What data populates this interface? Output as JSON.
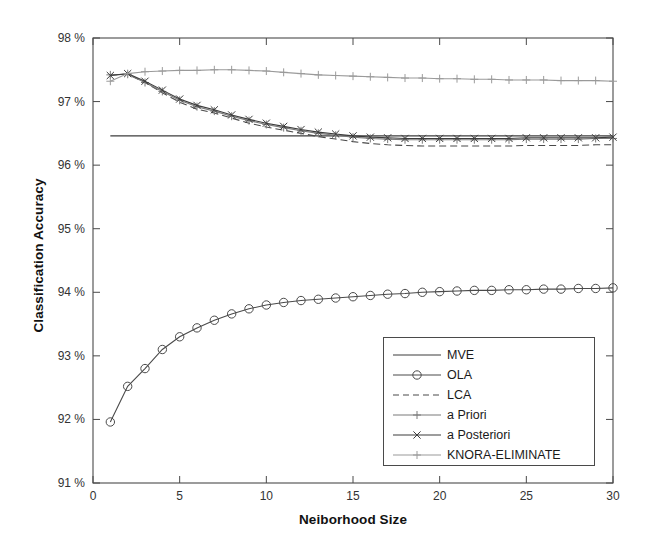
{
  "chart_data": {
    "type": "line",
    "title": "",
    "xlabel": "Neiborhood Size",
    "ylabel": "Classification Accuracy",
    "xlim": [
      0,
      30
    ],
    "ylim": [
      91,
      98
    ],
    "xticks": [
      0,
      5,
      10,
      15,
      20,
      25,
      30
    ],
    "yticks": [
      91,
      92,
      93,
      94,
      95,
      96,
      97,
      98
    ],
    "ytick_labels": [
      "91 %",
      "92 %",
      "93 %",
      "94 %",
      "95 %",
      "96 %",
      "97 %",
      "98 %"
    ],
    "xtick_labels": [
      "0",
      "5",
      "10",
      "15",
      "20",
      "25",
      "30"
    ],
    "grid": false,
    "legend_position": "lower-right",
    "x": [
      1,
      2,
      3,
      4,
      5,
      6,
      7,
      8,
      9,
      10,
      11,
      12,
      13,
      14,
      15,
      16,
      17,
      18,
      19,
      20,
      21,
      22,
      23,
      24,
      25,
      26,
      27,
      28,
      29,
      30
    ],
    "series": [
      {
        "name": "MVE",
        "style": "solid",
        "marker": "none",
        "color": "#3c3c3c",
        "values": [
          96.46,
          96.46,
          96.46,
          96.46,
          96.46,
          96.46,
          96.46,
          96.46,
          96.46,
          96.46,
          96.46,
          96.46,
          96.46,
          96.46,
          96.46,
          96.46,
          96.46,
          96.46,
          96.46,
          96.46,
          96.46,
          96.46,
          96.46,
          96.46,
          96.46,
          96.46,
          96.46,
          96.46,
          96.46,
          96.46
        ]
      },
      {
        "name": "OLA",
        "style": "solid",
        "marker": "circle",
        "color": "#4a4a4a",
        "values": [
          91.96,
          92.52,
          92.8,
          93.1,
          93.3,
          93.44,
          93.56,
          93.66,
          93.74,
          93.8,
          93.84,
          93.87,
          93.89,
          93.91,
          93.93,
          93.95,
          93.97,
          93.98,
          94.0,
          94.01,
          94.02,
          94.03,
          94.03,
          94.04,
          94.04,
          94.05,
          94.05,
          94.06,
          94.06,
          94.07
        ]
      },
      {
        "name": "LCA",
        "style": "dashed",
        "marker": "none",
        "color": "#4a4a4a",
        "values": [
          97.42,
          97.43,
          97.3,
          97.14,
          96.99,
          96.88,
          96.82,
          96.74,
          96.66,
          96.6,
          96.55,
          96.5,
          96.45,
          96.41,
          96.37,
          96.34,
          96.32,
          96.31,
          96.3,
          96.3,
          96.3,
          96.3,
          96.3,
          96.3,
          96.31,
          96.31,
          96.31,
          96.31,
          96.32,
          96.32
        ]
      },
      {
        "name": "a Priori",
        "style": "solid",
        "marker": "plus",
        "color": "#7a7a7a",
        "values": [
          97.42,
          97.43,
          97.3,
          97.16,
          97.02,
          96.92,
          96.85,
          96.77,
          96.7,
          96.64,
          96.59,
          96.54,
          96.5,
          96.47,
          96.44,
          96.42,
          96.41,
          96.4,
          96.4,
          96.4,
          96.4,
          96.4,
          96.4,
          96.4,
          96.41,
          96.41,
          96.41,
          96.41,
          96.42,
          96.42
        ]
      },
      {
        "name": "a Posteriori",
        "style": "solid",
        "marker": "cross",
        "color": "#3c3c3c",
        "values": [
          97.41,
          97.44,
          97.32,
          97.18,
          97.04,
          96.94,
          96.87,
          96.79,
          96.72,
          96.66,
          96.61,
          96.56,
          96.52,
          96.49,
          96.46,
          96.44,
          96.43,
          96.42,
          96.42,
          96.42,
          96.42,
          96.42,
          96.42,
          96.42,
          96.43,
          96.43,
          96.43,
          96.43,
          96.43,
          96.44
        ]
      },
      {
        "name": "KNORA-ELIMINATE",
        "style": "solid",
        "marker": "plus",
        "color": "#9a9a9a",
        "values": [
          97.32,
          97.44,
          97.47,
          97.48,
          97.49,
          97.49,
          97.5,
          97.5,
          97.49,
          97.48,
          97.46,
          97.44,
          97.42,
          97.41,
          97.4,
          97.39,
          97.38,
          97.37,
          97.37,
          97.36,
          97.36,
          97.35,
          97.35,
          97.34,
          97.34,
          97.34,
          97.33,
          97.33,
          97.33,
          97.32
        ]
      }
    ]
  },
  "legend": {
    "entries": [
      {
        "label": "MVE"
      },
      {
        "label": "OLA"
      },
      {
        "label": "LCA"
      },
      {
        "label": "a Priori"
      },
      {
        "label": "a Posteriori"
      },
      {
        "label": "KNORA-ELIMINATE"
      }
    ]
  }
}
